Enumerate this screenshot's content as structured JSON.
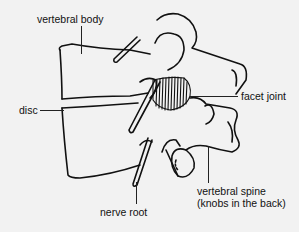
{
  "diagram": {
    "labels": {
      "vertebral_body": "vertebral body",
      "disc": "disc",
      "facet_joint": "facet joint",
      "nerve_root": "nerve root",
      "vertebral_spine_line1": "vertebral spine",
      "vertebral_spine_line2": "(knobs in the back)"
    },
    "colors": {
      "background": "#f2f2f2",
      "ink": "#111111"
    }
  }
}
